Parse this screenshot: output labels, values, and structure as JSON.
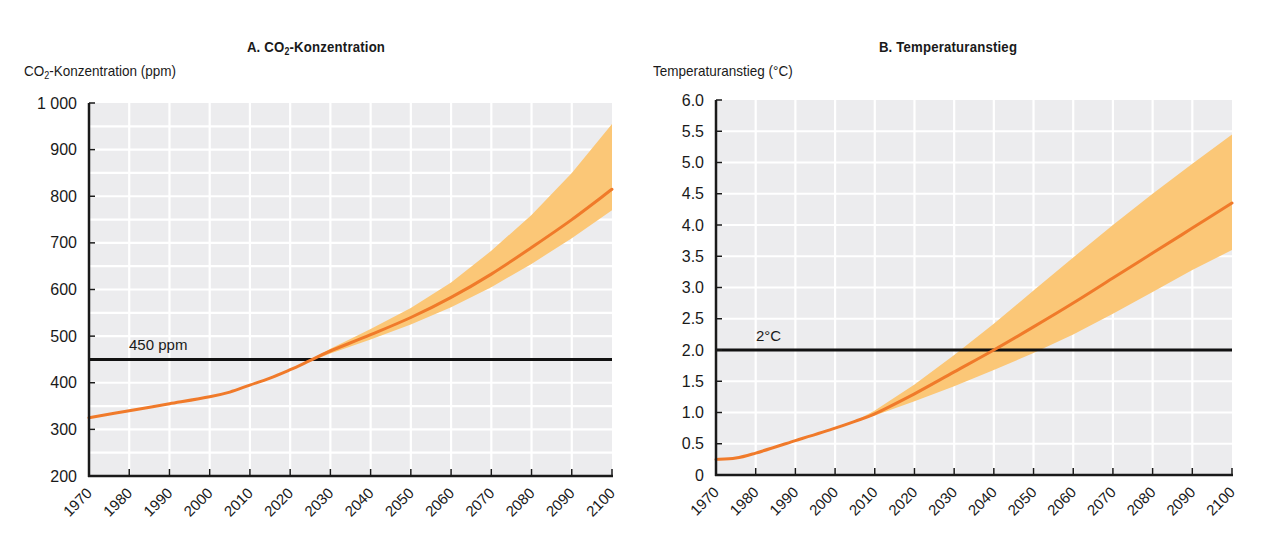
{
  "page": {
    "colors": {
      "plot_bg": "#ececee",
      "grid": "#ffffff",
      "axis": "#1a1a1a",
      "line": "#f07a2a",
      "band": "#fbc777",
      "threshold": "#111111"
    }
  },
  "chart_a": {
    "title_prefix": "A. CO",
    "title_sub": "2",
    "title_suffix": "-Konzentration",
    "ylabel_prefix": "CO",
    "ylabel_sub": "2",
    "ylabel_suffix": "-Konzentration (ppm)",
    "threshold_label": "450 ppm"
  },
  "chart_b": {
    "title": "B. Temperaturanstieg",
    "ylabel": "Temperaturanstieg (°C)",
    "threshold_label": "2°C"
  },
  "chart_data": [
    {
      "type": "line",
      "title": "A. CO2-Konzentration",
      "xlabel": "",
      "ylabel": "CO2-Konzentration (ppm)",
      "xlim": [
        1970,
        2100
      ],
      "ylim": [
        200,
        1000
      ],
      "grid": true,
      "x_ticks": [
        1970,
        1980,
        1990,
        2000,
        2010,
        2020,
        2030,
        2040,
        2050,
        2060,
        2070,
        2080,
        2090,
        2100
      ],
      "y_ticks": [
        200,
        300,
        400,
        500,
        600,
        700,
        800,
        900,
        1000
      ],
      "y_tick_labels": [
        "200",
        "300",
        "400",
        "500",
        "600",
        "700",
        "800",
        "900",
        "1 000"
      ],
      "x_grid_step": 10,
      "y_grid_step": 50,
      "series": [
        {
          "name": "central",
          "x": [
            1970,
            1980,
            1990,
            2000,
            2005,
            2010,
            2015,
            2020,
            2025,
            2030,
            2040,
            2050,
            2060,
            2070,
            2080,
            2090,
            2100
          ],
          "values": [
            325,
            340,
            355,
            370,
            380,
            395,
            410,
            428,
            448,
            468,
            503,
            540,
            583,
            633,
            690,
            750,
            815
          ]
        }
      ],
      "band": {
        "name": "uncertainty range",
        "x": [
          2020,
          2025,
          2030,
          2040,
          2050,
          2060,
          2070,
          2080,
          2090,
          2100
        ],
        "upper": [
          428,
          450,
          473,
          515,
          560,
          615,
          683,
          760,
          850,
          955
        ],
        "lower": [
          428,
          446,
          463,
          493,
          525,
          562,
          605,
          655,
          710,
          770
        ]
      },
      "threshold": {
        "value": 450,
        "label": "450 ppm"
      }
    },
    {
      "type": "line",
      "title": "B. Temperaturanstieg",
      "xlabel": "",
      "ylabel": "Temperaturanstieg (°C)",
      "xlim": [
        1970,
        2100
      ],
      "ylim": [
        0,
        6.0
      ],
      "grid": true,
      "x_ticks": [
        1970,
        1980,
        1990,
        2000,
        2010,
        2020,
        2030,
        2040,
        2050,
        2060,
        2070,
        2080,
        2090,
        2100
      ],
      "y_ticks": [
        0,
        0.5,
        1.0,
        1.5,
        2.0,
        2.5,
        3.0,
        3.5,
        4.0,
        4.5,
        5.0,
        5.5,
        6.0
      ],
      "y_tick_labels": [
        "0",
        "0.5",
        "1.0",
        "1.5",
        "2.0",
        "2.5",
        "3.0",
        "3.5",
        "4.0",
        "4.5",
        "5.0",
        "5.5",
        "6.0"
      ],
      "x_grid_step": 10,
      "y_grid_step": 0.5,
      "series": [
        {
          "name": "central",
          "x": [
            1970,
            1975,
            1980,
            1990,
            2000,
            2005,
            2010,
            2020,
            2030,
            2040,
            2050,
            2060,
            2070,
            2080,
            2090,
            2100
          ],
          "values": [
            0.25,
            0.27,
            0.35,
            0.55,
            0.75,
            0.86,
            0.98,
            1.3,
            1.65,
            2.0,
            2.37,
            2.75,
            3.15,
            3.55,
            3.95,
            4.35
          ]
        }
      ],
      "band": {
        "name": "uncertainty range",
        "x": [
          2005,
          2010,
          2020,
          2030,
          2040,
          2050,
          2060,
          2070,
          2080,
          2090,
          2100
        ],
        "upper": [
          0.86,
          1.03,
          1.45,
          1.92,
          2.42,
          2.95,
          3.48,
          4.0,
          4.5,
          4.98,
          5.45
        ],
        "lower": [
          0.86,
          0.95,
          1.18,
          1.42,
          1.68,
          1.95,
          2.25,
          2.58,
          2.93,
          3.28,
          3.6
        ]
      },
      "threshold": {
        "value": 2.0,
        "label": "2°C"
      }
    }
  ]
}
